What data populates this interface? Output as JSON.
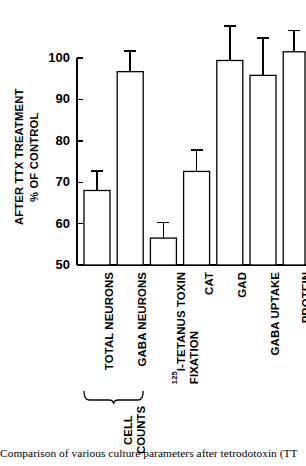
{
  "figure": {
    "caption": "Comparison of various culture parameters after tetrodotoxin (TT"
  },
  "chart_data": {
    "type": "bar",
    "title": "",
    "xlabel": "",
    "ylabel": "% OF CONTROL AFTER TTX TREATMENT",
    "ylabel_line1": "% OF CONTROL",
    "ylabel_line2": "AFTER TTX TREATMENT",
    "ylim": [
      50,
      100
    ],
    "yticks": [
      50,
      60,
      70,
      80,
      90,
      100
    ],
    "ytick_labels": [
      "50",
      "60",
      "70",
      "80",
      "90",
      "100"
    ],
    "grid": false,
    "legend": false,
    "bar_fill": "#ffffff",
    "bar_edge": "#000000",
    "categories": [
      "TOTAL NEURONS",
      "GABA NEURONS",
      "125I-TETANUS TOXIN FIXATION",
      "CAT",
      "GAD",
      "GABA UPTAKE",
      "PROTEIN"
    ],
    "category_labels": [
      {
        "text": "TOTAL NEURONS",
        "lines": [
          "TOTAL NEURONS"
        ],
        "superscript": ""
      },
      {
        "text": "GABA NEURONS",
        "lines": [
          "GABA NEURONS"
        ],
        "superscript": ""
      },
      {
        "text": "125I-TETANUS TOXIN FIXATION",
        "lines": [
          "I-TETANUS TOXIN",
          "FIXATION"
        ],
        "superscript": "125"
      },
      {
        "text": "CAT",
        "lines": [
          "CAT"
        ],
        "superscript": ""
      },
      {
        "text": "GAD",
        "lines": [
          "GAD"
        ],
        "superscript": ""
      },
      {
        "text": "GABA UPTAKE",
        "lines": [
          "GABA UPTAKE"
        ],
        "superscript": ""
      },
      {
        "text": "PROTEIN",
        "lines": [
          "PROTEIN"
        ],
        "superscript": ""
      }
    ],
    "values": [
      68.0,
      96.7,
      56.5,
      72.6,
      99.4,
      95.8,
      101.5
    ],
    "errors": [
      4.7,
      5.0,
      3.8,
      5.2,
      8.3,
      9.0,
      5.1
    ],
    "error_upper": [
      72.7,
      101.7,
      60.3,
      77.8,
      107.7,
      104.8,
      106.6
    ],
    "group_brace": {
      "label": "CELL COUNTS",
      "label_line1": "CELL",
      "label_line2": "COUNTS",
      "covers": [
        "TOTAL NEURONS",
        "GABA NEURONS"
      ]
    }
  }
}
